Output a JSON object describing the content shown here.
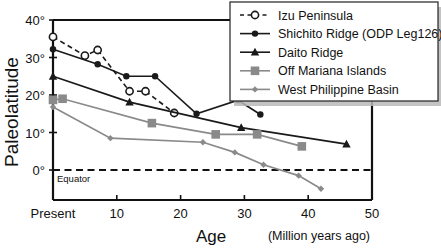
{
  "chart_data": {
    "type": "line",
    "title": "",
    "xlabel": "Age",
    "xunits": "(Million years ago)",
    "ylabel": "Paleolatitude",
    "xlim": [
      0,
      50
    ],
    "ylim": [
      -8,
      40
    ],
    "grid": false,
    "legend_position": "top-right",
    "x_ticks": [
      {
        "value": 0,
        "label": "Present"
      },
      {
        "value": 10,
        "label": "10"
      },
      {
        "value": 20,
        "label": "20"
      },
      {
        "value": 30,
        "label": "30"
      },
      {
        "value": 40,
        "label": "40"
      },
      {
        "value": 50,
        "label": "50"
      }
    ],
    "y_ticks": [
      {
        "value": 0,
        "label": "0°"
      },
      {
        "value": 10,
        "label": "10°"
      },
      {
        "value": 20,
        "label": "20°"
      },
      {
        "value": 30,
        "label": "30°"
      },
      {
        "value": 40,
        "label": "40°"
      }
    ],
    "annotations": [
      {
        "name": "equator-line",
        "type": "hline",
        "y": 0,
        "label": "Equator",
        "style": "dashed"
      }
    ],
    "series": [
      {
        "name": "Izu Peninsula",
        "marker": "open-circle",
        "line": "dashed",
        "color": "#1a1a1a",
        "points": [
          [
            0,
            35.5
          ],
          [
            5,
            30.5
          ],
          [
            7,
            32.0
          ],
          [
            12,
            21.0
          ],
          [
            14.5,
            21.0
          ],
          [
            19,
            15.2
          ]
        ]
      },
      {
        "name": "Shichito Ridge (ODP Leg126)",
        "marker": "filled-circle",
        "line": "solid",
        "color": "#1a1a1a",
        "points": [
          [
            0,
            32.2
          ],
          [
            7,
            28.2
          ],
          [
            11.5,
            25.0
          ],
          [
            16,
            25.0
          ],
          [
            22.5,
            15.0
          ],
          [
            29,
            18.6
          ],
          [
            32.5,
            14.8
          ]
        ]
      },
      {
        "name": "Daito Ridge",
        "marker": "filled-triangle",
        "line": "solid",
        "color": "#1a1a1a",
        "points": [
          [
            0,
            25.0
          ],
          [
            12,
            18.1
          ],
          [
            29.5,
            11.3
          ],
          [
            46,
            6.9
          ]
        ]
      },
      {
        "name": "Off Mariana Islands",
        "marker": "filled-square",
        "line": "solid",
        "color": "#8a8a8a",
        "points": [
          [
            0,
            18.7
          ],
          [
            1.5,
            19.0
          ],
          [
            15.5,
            12.5
          ],
          [
            25.5,
            9.5
          ],
          [
            32,
            9.5
          ],
          [
            39,
            6.3
          ]
        ]
      },
      {
        "name": "West Philippine Basin",
        "marker": "small-diamond",
        "line": "solid",
        "color": "#8a8a8a",
        "points": [
          [
            0,
            16.8
          ],
          [
            9,
            8.5
          ],
          [
            23.5,
            7.4
          ],
          [
            28.5,
            4.7
          ],
          [
            33,
            1.4
          ],
          [
            38.5,
            -1.5
          ],
          [
            42,
            -5.0
          ]
        ]
      }
    ]
  },
  "legend": {
    "entries": [
      {
        "label": "Izu Peninsula",
        "marker": "open-circle",
        "line": "dashed",
        "color": "#1a1a1a"
      },
      {
        "label": "Shichito Ridge (ODP Leg126)",
        "marker": "filled-circle",
        "line": "solid",
        "color": "#1a1a1a"
      },
      {
        "label": "Daito Ridge",
        "marker": "filled-triangle",
        "line": "solid",
        "color": "#1a1a1a"
      },
      {
        "label": "Off Mariana Islands",
        "marker": "filled-square",
        "line": "solid",
        "color": "#8a8a8a"
      },
      {
        "label": "West Philippine Basin",
        "marker": "small-diamond",
        "line": "solid",
        "color": "#8a8a8a"
      }
    ]
  }
}
